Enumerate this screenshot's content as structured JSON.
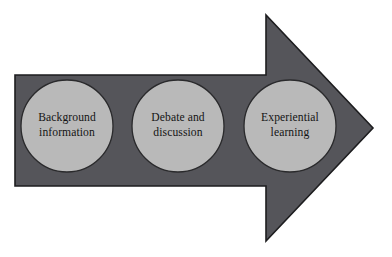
{
  "diagram": {
    "type": "process-arrow",
    "direction": "right",
    "background_color": "#ffffff",
    "arrow": {
      "name": "right-block-arrow",
      "fill_color": "#55555a",
      "outline_color": "#1d1d1f",
      "outline_width": 1,
      "shaft": {
        "x": 15,
        "y": 75,
        "width": 251,
        "height": 111
      },
      "head": {
        "base_x": 266,
        "tip_x": 373,
        "top_y": 15,
        "bottom_y": 241,
        "tip_y": 128
      }
    },
    "circle_style": {
      "fill_color": "#b9b9b9",
      "outline_color": "#2a2a2c",
      "outline_width": 1,
      "diameter": 92
    },
    "stages": [
      {
        "id": "background-information",
        "order": 1,
        "label": "Background information",
        "lines": [
          "Background",
          "information"
        ],
        "center_x": 67,
        "center_y": 126
      },
      {
        "id": "debate-and-discussion",
        "order": 2,
        "label": "Debate and discussion",
        "lines": [
          "Debate and",
          "discussion"
        ],
        "center_x": 178,
        "center_y": 126
      },
      {
        "id": "experiential-learning",
        "order": 3,
        "label": "Experiential learning",
        "lines": [
          "Experiential",
          "learning"
        ],
        "center_x": 290,
        "center_y": 126
      }
    ]
  }
}
